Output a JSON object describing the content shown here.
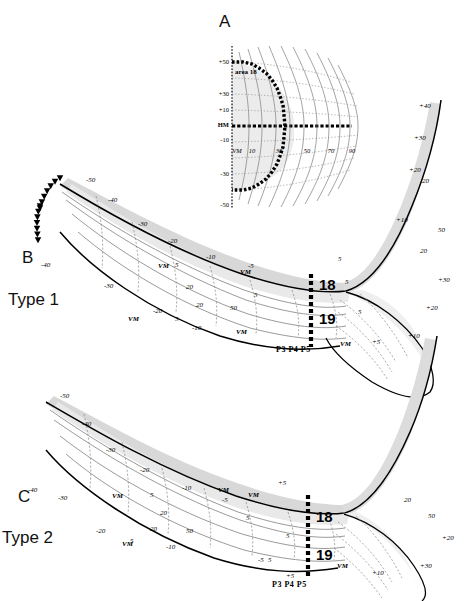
{
  "figure": {
    "caption_absent": true,
    "panels": [
      {
        "id": "A",
        "letter": "A",
        "type": "visual-field-map",
        "inner_label": "area 18",
        "axis_vertical_ticks": [
          "+50",
          "+30",
          "+10",
          "HM",
          "-10",
          "-30",
          "-50"
        ],
        "axis_horizontal_ticks": [
          "VM",
          "10",
          "30",
          "50",
          "70",
          "90"
        ],
        "meridian_labels": {
          "horizontal": "HM",
          "vertical": "VM"
        }
      },
      {
        "id": "B",
        "letter": "B",
        "type_label": "Type 1",
        "area_labels": [
          "18",
          "19"
        ],
        "electrode_labels": "P3 P4 P5",
        "upper_contours": [
          "-50",
          "-40",
          "-30",
          "-20",
          "-10",
          "-5"
        ],
        "lower_contours": [
          "-30",
          "-20",
          "-10",
          "-5"
        ],
        "inner_contours": [
          "5",
          "20",
          "50"
        ],
        "right_contours": [
          "+40",
          "+30",
          "+20",
          "+10",
          "+5"
        ],
        "vm_labels": [
          "VM",
          "VM",
          "VM"
        ],
        "star_markers": 2
      },
      {
        "id": "C",
        "letter": "C",
        "type_label": "Type 2",
        "area_labels": [
          "18",
          "19"
        ],
        "electrode_labels": "P3 P4 P5",
        "upper_contours": [
          "-50",
          "-40",
          "-30",
          "-20",
          "-10",
          "-5"
        ],
        "lower_contours": [
          "-30",
          "-20",
          "-10",
          "-5"
        ],
        "inner_contours": [
          "5",
          "20",
          "50"
        ],
        "right_contours": [
          "+30",
          "+20",
          "+10",
          "+5"
        ],
        "vm_labels": [
          "VM",
          "VM",
          "VM"
        ],
        "star_markers": 2
      }
    ]
  },
  "chart_data": {
    "type": "line",
    "title": "",
    "subtitle": "",
    "xlabel": "",
    "ylabel": "",
    "grid": true,
    "legend_position": "none",
    "panelA": {
      "type": "line",
      "elevation_ticks": [
        50,
        30,
        10,
        0,
        -10,
        -30,
        -50
      ],
      "elevation_tick_labels": [
        "+50",
        "+30",
        "+10",
        "HM",
        "-10",
        "-30",
        "-50"
      ],
      "azimuth_ticks": [
        0,
        10,
        30,
        50,
        70,
        90
      ],
      "azimuth_tick_labels": [
        "VM",
        "10",
        "30",
        "50",
        "70",
        "90"
      ],
      "annotations": [
        "area 18",
        "HM",
        "VM"
      ],
      "xlim": [
        0,
        95
      ],
      "ylim": [
        -60,
        60
      ]
    },
    "panelB": {
      "type": "line",
      "title": "Type 1",
      "iso_elevation_values": [
        -50,
        -40,
        -30,
        -20,
        -10,
        -5,
        5,
        20,
        50
      ],
      "iso_azimuth_values": [
        5,
        10,
        20,
        30,
        40,
        50
      ],
      "right_field_values": [
        5,
        10,
        20,
        30,
        40
      ],
      "areas": [
        "18",
        "19"
      ],
      "boundary_markers": [
        "filled-triangle",
        "filled-square",
        "open-circle"
      ],
      "electrodes": [
        "P3",
        "P4",
        "P5"
      ]
    },
    "panelC": {
      "type": "line",
      "title": "Type 2",
      "iso_elevation_values": [
        -50,
        -40,
        -30,
        -20,
        -10,
        -5,
        5,
        20,
        50
      ],
      "iso_azimuth_values": [
        5,
        10,
        20,
        30,
        40,
        50
      ],
      "right_field_values": [
        5,
        10,
        20,
        30
      ],
      "areas": [
        "18",
        "19"
      ],
      "boundary_markers": [
        "filled-triangle",
        "filled-square",
        "open-circle"
      ],
      "electrodes": [
        "P3",
        "P4",
        "P5"
      ]
    }
  },
  "labels": {
    "panelA_letter": "A",
    "panelB_letter": "B",
    "panelC_letter": "C",
    "type1": "Type 1",
    "type2": "Type 2",
    "area18": "18",
    "area19": "19",
    "area18_inner": "area 18",
    "electrodes": "P3 P4 P5",
    "hm": "HM",
    "vm": "VM",
    "t_neg50": "-50",
    "t_neg40": "-40",
    "t_neg30": "-30",
    "t_neg20": "-20",
    "t_neg10": "-10",
    "t_neg5": "-5",
    "t_5": "5",
    "t_20": "20",
    "t_50": "50",
    "t_pos50": "+50",
    "t_pos40": "+40",
    "t_pos30": "+30",
    "t_pos20": "+20",
    "t_pos10": "+10",
    "t_pos5": "+5",
    "t_10": "10",
    "t_30": "30",
    "t_70": "70",
    "t_90": "90"
  },
  "colors": {
    "ink": "#000000",
    "band_fill": "#d8d8d8",
    "band_fill_light": "#e9e9e9",
    "contour": "#6b6b6b",
    "contour_dash": "#8a8a8a",
    "background": "#ffffff"
  }
}
